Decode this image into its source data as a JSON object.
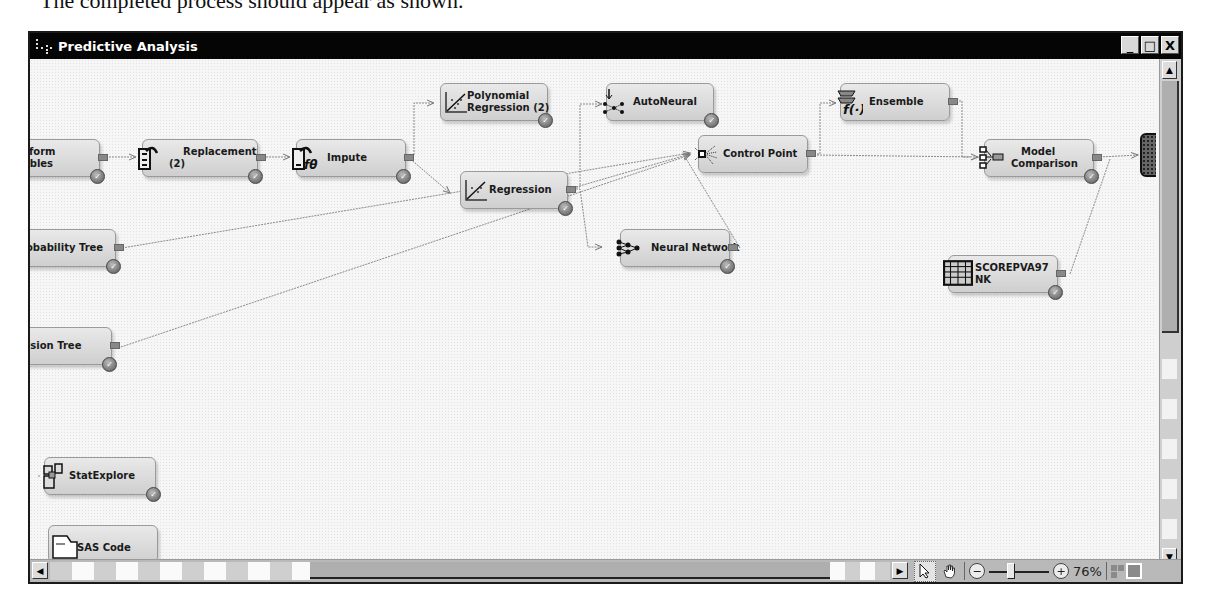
{
  "caption": "The completed process should appear as shown.",
  "window": {
    "title": "Predictive Analysis",
    "buttons": {
      "minimize": "_",
      "maximize": "□",
      "close": "X"
    }
  },
  "nodes": [
    {
      "id": "transform",
      "label_line1": "sform",
      "label_line2": "ables",
      "icon": "transform-icon"
    },
    {
      "id": "replacement",
      "label_line1": "Replacement",
      "label_line2": "(2)",
      "icon": "replacement-icon"
    },
    {
      "id": "impute",
      "label_line1": "Impute",
      "label_line2": "",
      "icon": "impute-icon"
    },
    {
      "id": "poly",
      "label_line1": "Polynomial",
      "label_line2": "Regression (2)",
      "icon": "regression-icon"
    },
    {
      "id": "regression",
      "label_line1": "Regression",
      "label_line2": "",
      "icon": "regression-icon"
    },
    {
      "id": "autoneural",
      "label_line1": "AutoNeural",
      "label_line2": "",
      "icon": "autoneural-icon"
    },
    {
      "id": "control",
      "label_line1": "Control Point",
      "label_line2": "",
      "icon": "control-point-icon"
    },
    {
      "id": "neural",
      "label_line1": "Neural Network",
      "label_line2": "",
      "icon": "neural-network-icon"
    },
    {
      "id": "ensemble",
      "label_line1": "Ensemble",
      "label_line2": "",
      "icon": "ensemble-icon"
    },
    {
      "id": "modelcomp",
      "label_line1": "Model",
      "label_line2": "Comparison",
      "icon": "model-comparison-icon"
    },
    {
      "id": "score",
      "label_line1": "SCOREPVA97",
      "label_line2": "NK",
      "icon": "data-table-icon"
    },
    {
      "id": "probtree",
      "label_line1": "robability Tree",
      "label_line2": "",
      "icon": "tree-icon"
    },
    {
      "id": "dectree",
      "label_line1": "cision Tree",
      "label_line2": "",
      "icon": "tree-icon"
    },
    {
      "id": "statexplore",
      "label_line1": "StatExplore",
      "label_line2": "",
      "icon": "statexplore-icon"
    },
    {
      "id": "sascode",
      "label_line1": "SAS Code",
      "label_line2": "",
      "icon": "sas-code-icon"
    }
  ],
  "toolbar": {
    "select_tool": "select-arrow",
    "pan_tool": "pan-hand",
    "zoom_out": "−",
    "zoom_in": "+",
    "zoom_level": "76%"
  },
  "scroll": {
    "left": "◀",
    "right": "▶",
    "up": "▲",
    "down": "▼"
  }
}
